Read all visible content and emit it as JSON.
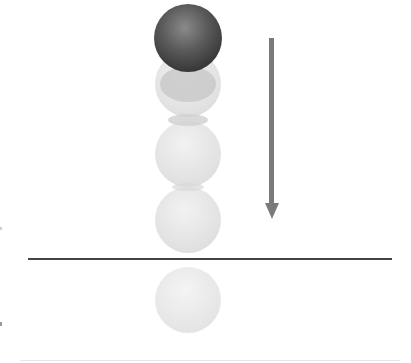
{
  "diagram": {
    "colors": {
      "solid_ball": "#444444",
      "ghost_ball": "#e2e2e2",
      "arrow": "#7a7a7a",
      "ground": "#444444",
      "background": "#ffffff"
    },
    "balls": [
      {
        "id": "ball-1",
        "type": "solid",
        "cx": 188,
        "cy": 38,
        "r": 34
      },
      {
        "id": "ball-2",
        "type": "ghost",
        "cx": 188,
        "cy": 84,
        "r": 33
      },
      {
        "id": "ball-3",
        "type": "ghost",
        "cx": 188,
        "cy": 154,
        "r": 33
      },
      {
        "id": "ball-4",
        "type": "ghost",
        "cx": 188,
        "cy": 220,
        "r": 33
      },
      {
        "id": "reflection",
        "type": "ghost",
        "cx": 188,
        "cy": 300,
        "r": 33
      }
    ],
    "arrow": {
      "direction": "down",
      "x": 272,
      "y_start": 38,
      "y_end": 218
    },
    "ground_line": {
      "x1": 28,
      "x2": 392,
      "y": 259
    }
  }
}
